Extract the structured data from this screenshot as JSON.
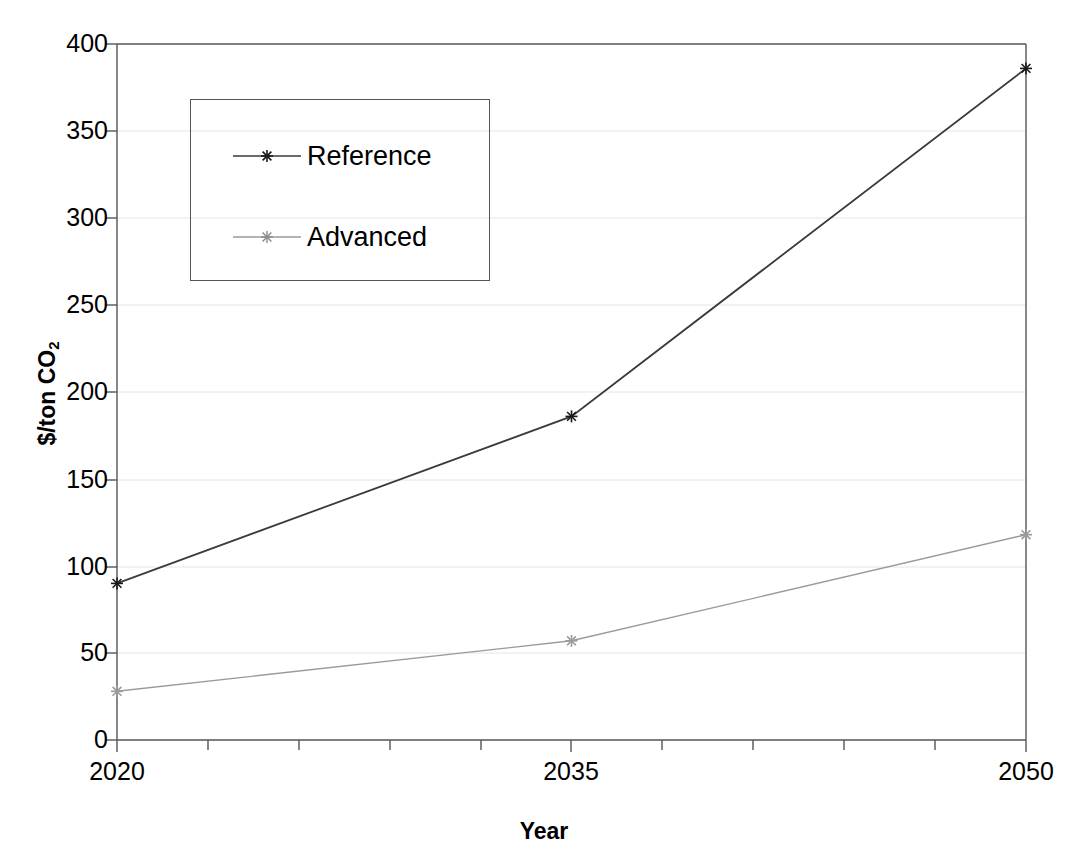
{
  "chart_data": {
    "type": "line",
    "title": "",
    "xlabel": "Year",
    "ylabel": "$/ton CO2",
    "ylabel_base": "$/ton CO",
    "ylabel_sub": "2",
    "x": [
      2020,
      2035,
      2050
    ],
    "categories": [
      "2020",
      "2035",
      "2050"
    ],
    "series": [
      {
        "name": "Reference",
        "values": [
          90,
          186,
          386
        ],
        "color": "#3a3a3a"
      },
      {
        "name": "Advanced",
        "values": [
          28,
          57,
          118
        ],
        "color": "#9a9a9a"
      }
    ],
    "xlim": [
      2020,
      2050
    ],
    "ylim": [
      0,
      400
    ],
    "ytick_labels": [
      "400",
      "350",
      "300",
      "250",
      "200",
      "150",
      "100",
      "50",
      "0"
    ],
    "ytick_values": [
      400,
      350,
      300,
      250,
      200,
      150,
      100,
      50,
      0
    ],
    "xtick_labels": [
      "2020",
      "2035",
      "2050"
    ],
    "grid": "horizontal",
    "grid_color": "#e6e6e6",
    "legend_position": "upper-left-inside",
    "marker": "asterisk",
    "axis_color": "#555555",
    "background": "#ffffff"
  },
  "legend": {
    "items": [
      {
        "label": "Reference",
        "marker": "asterisk-marker-icon"
      },
      {
        "label": "Advanced",
        "marker": "asterisk-marker-icon"
      }
    ]
  },
  "axes": {
    "y_title": "$/ton CO",
    "y_title_sub": "2",
    "x_title": "Year"
  }
}
